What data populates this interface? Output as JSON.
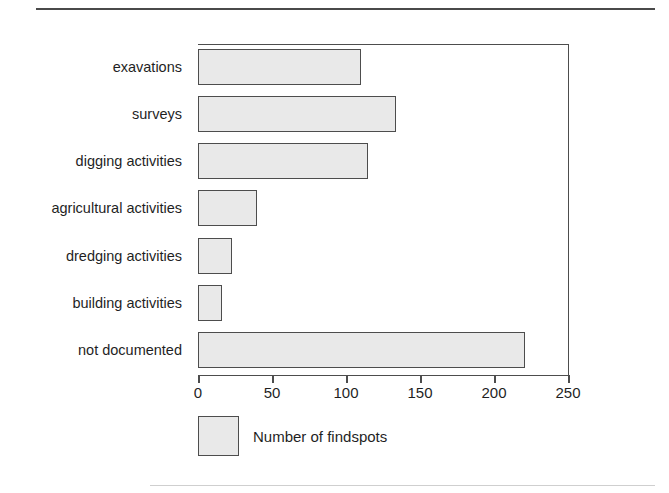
{
  "figure": {
    "rule_top": "horizontal-rule",
    "rule_bottom": "horizontal-rule"
  },
  "chart_data": {
    "type": "bar",
    "orientation": "horizontal",
    "title": "",
    "xlabel": "",
    "ylabel": "",
    "categories": [
      "exavations",
      "surveys",
      "digging activities",
      "agricultural activities",
      "dredging activities",
      "building activities",
      "not documented"
    ],
    "values": [
      110,
      134,
      115,
      40,
      23,
      16,
      221
    ],
    "series": [
      {
        "name": "Number of findspots",
        "values": [
          110,
          134,
          115,
          40,
          23,
          16,
          221
        ]
      }
    ],
    "xlim": [
      0,
      250
    ],
    "xticks": [
      0,
      50,
      100,
      150,
      200,
      250
    ],
    "xtick_labels": [
      "0",
      "50",
      "100",
      "150",
      "200",
      "250"
    ],
    "grid": false,
    "legend": {
      "position": "below-axis-left",
      "entries": [
        {
          "label": "Number of findspots",
          "color": "#e9e9e9"
        }
      ]
    },
    "colors": {
      "bar_fill": "#e9e9e9",
      "bar_edge": "#4d4d4d",
      "axis": "#4d4d4d",
      "text": "#1f1f1f",
      "background": "#ffffff"
    }
  }
}
